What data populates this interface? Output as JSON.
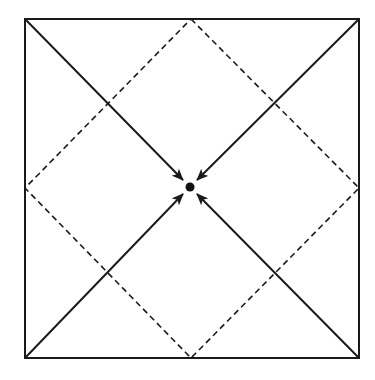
{
  "diagram": {
    "colors": {
      "stroke": "#1a1a1a",
      "background": "#ffffff"
    },
    "square": {
      "x1": 25,
      "y1": 19,
      "x2": 359,
      "y2": 358
    },
    "center": {
      "x": 190,
      "y": 187,
      "radius": 4.5
    },
    "diamond": {
      "style": "dashed",
      "vertices": [
        [
          191,
          19
        ],
        [
          359,
          188
        ],
        [
          191,
          358
        ],
        [
          25,
          188
        ]
      ]
    },
    "arrows": [
      {
        "from": [
          25,
          19
        ],
        "to": [
          183,
          180
        ],
        "name": "top-left"
      },
      {
        "from": [
          359,
          19
        ],
        "to": [
          197,
          180
        ],
        "name": "top-right"
      },
      {
        "from": [
          25,
          358
        ],
        "to": [
          183,
          194
        ],
        "name": "bottom-left"
      },
      {
        "from": [
          359,
          358
        ],
        "to": [
          197,
          194
        ],
        "name": "bottom-right"
      }
    ]
  }
}
